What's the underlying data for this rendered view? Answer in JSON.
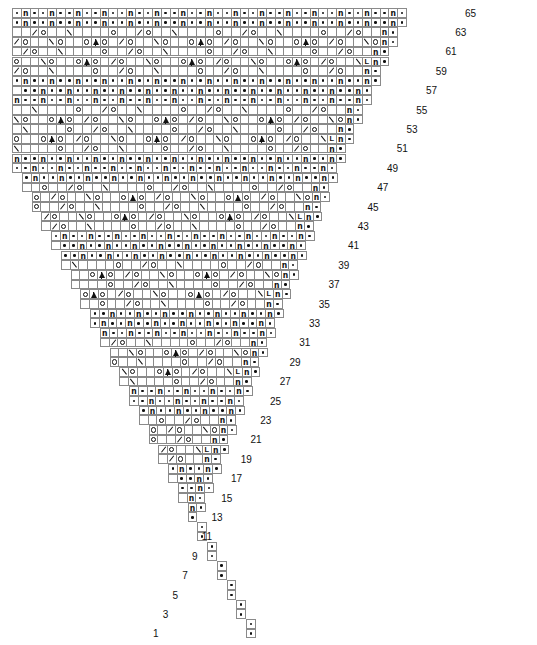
{
  "chart": {
    "type": "knitting-chart",
    "total_rows": 65,
    "row_label_parity": "odd",
    "cell_width_px": 9.75,
    "cell_height_px": 9.7,
    "grid_color": "#8a8a8a",
    "symbol_color": "#111111",
    "background_color": "#ffffff",
    "legend": {
      "purl": "•",
      "yarn_over": "o",
      "k2tog": "/",
      "ssk": "\\",
      "twisted_knit": "ʘ",
      "make_one": "L",
      "central_double_decrease": "▲"
    },
    "row_numbers": [
      65,
      63,
      61,
      59,
      57,
      55,
      53,
      51,
      49,
      47,
      45,
      43,
      41,
      39,
      37,
      35,
      33,
      31,
      29,
      27,
      25,
      23,
      21,
      19,
      17,
      15,
      13,
      11,
      9,
      7,
      5,
      3,
      1
    ],
    "rows": [
      {
        "n": 65,
        "x": 0,
        "cells": "..K..K..K..K..K..K..........K..K..K..K..K..........K..K..K..K..KK."
      },
      {
        "n": 64,
        "x": 0,
        "cells": ".._/K..K..K..K..K\\O__/K..K..K..K..K\\O__/K..K..K..K..LK."
      },
      {
        "n": 63,
        "x": 0,
        "cells": "...........................................................K."
      },
      {
        "n": 62,
        "x": 0,
        "cells": "._O_\\O_\\O____/__/_OAO_\\O_\\O____/__/_OAO_\\O_\\O____/__/_OK."
      },
      {
        "n": 61,
        "x": 0,
        "cells": ".K...................K...................K...............K."
      },
      {
        "n": 60,
        "x": 0,
        "cells": ".K\\O_\\O_\\O__/__/__/K\\O_\\O_\\O__/__/__/K\\O_\\O____/__/_OK."
      }
    ]
  }
}
